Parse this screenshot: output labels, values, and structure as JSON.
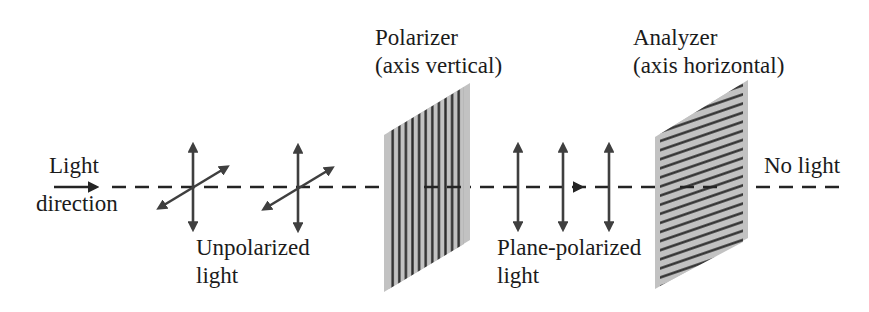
{
  "diagram": {
    "labels": {
      "light_direction_line1": "Light",
      "light_direction_line2": "direction",
      "unpolarized_line1": "Unpolarized",
      "unpolarized_line2": "light",
      "polarizer_line1": "Polarizer",
      "polarizer_line2": "(axis vertical)",
      "plane_polarized_line1": "Plane-polarized",
      "plane_polarized_line2": "light",
      "analyzer_line1": "Analyzer",
      "analyzer_line2": "(axis horizontal)",
      "no_light": "No light"
    },
    "colors": {
      "background": "#ffffff",
      "text": "#1b1b1b",
      "arrow": "#3f3f3f",
      "dashed_line": "#242424",
      "panel_fill": "#c2c2c2",
      "panel_stripe": "#2e2e2e"
    }
  }
}
